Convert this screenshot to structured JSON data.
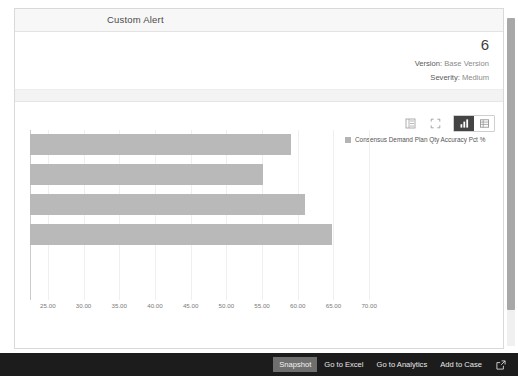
{
  "card": {
    "title": "Custom Alert",
    "alert_count": "6",
    "meta": {
      "version_label": "Version:",
      "version_value": "Base Version",
      "severity_label": "Severity:",
      "severity_value": "Medium"
    }
  },
  "toolbar": {
    "buttons": [
      {
        "name": "list-view-icon",
        "label": "List View",
        "state": "normal"
      },
      {
        "name": "fullscreen-icon",
        "label": "Full Screen",
        "state": "normal"
      },
      {
        "name": "bar-chart-view-icon",
        "label": "Chart View",
        "state": "active"
      },
      {
        "name": "table-view-icon",
        "label": "Table View",
        "state": "inactive"
      }
    ]
  },
  "legend": {
    "swatch_color": "#b4b4b4",
    "label": "Consensus Demand Plan Qty Accuracy Pct %"
  },
  "chart_data": {
    "type": "bar",
    "orientation": "horizontal",
    "title": "",
    "xlabel": "",
    "ylabel": "",
    "categories": [
      "Series 1",
      "Series 2",
      "Series 3",
      "Series 4"
    ],
    "values": [
      59.0,
      55.2,
      61.0,
      64.8
    ],
    "series": [
      {
        "name": "Consensus Demand Plan Qty Accuracy Pct %",
        "color": "#b9b9b9",
        "values": [
          59.0,
          55.2,
          61.0,
          64.8
        ]
      }
    ],
    "xlim": [
      22.5,
      72.5
    ],
    "x_ticks": [
      "25.00",
      "30.00",
      "35.00",
      "40.00",
      "45.00",
      "50.00",
      "55.00",
      "60.00",
      "65.00",
      "70.00"
    ],
    "x_tick_values": [
      25,
      30,
      35,
      40,
      45,
      50,
      55,
      60,
      65,
      70
    ],
    "grid": true,
    "legend_position": "top-right"
  },
  "scrollbar": {
    "name": "vertical-scrollbar"
  },
  "action_bar": {
    "buttons": [
      {
        "label": "Snapshot",
        "selected": true
      },
      {
        "label": "Go to Excel",
        "selected": false
      },
      {
        "label": "Go to Analytics",
        "selected": false
      },
      {
        "label": "Add to Case",
        "selected": false
      }
    ],
    "open_external_icon": "open-in-new-icon"
  },
  "colors": {
    "bar": "#b9b9b9",
    "action_bar_bg": "#1c1c1c",
    "selected_button_bg": "#6f6f6f",
    "active_toolbar_bg": "#444444"
  }
}
